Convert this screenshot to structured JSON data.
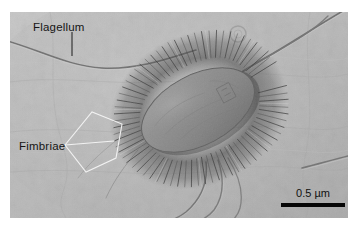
{
  "figure": {
    "kind": "scanning-electron-micrograph",
    "background_color": "#ffffff",
    "plate_color": "#b9b9b9"
  },
  "annotations": [
    {
      "id": "flagellum",
      "label": "Flagellum",
      "leader": "vertical-line",
      "color": "#151515"
    },
    {
      "id": "fimbriae",
      "label": "Fimbriae",
      "leader": "white-wedge-bracket",
      "color": "#151515"
    }
  ],
  "labels": {
    "flagellum": "Flagellum",
    "fimbriae": "Fimbriae"
  },
  "scale_bar": {
    "text": "0.5 µm",
    "value": 0.5,
    "unit": "µm",
    "bar_color": "#060606"
  }
}
